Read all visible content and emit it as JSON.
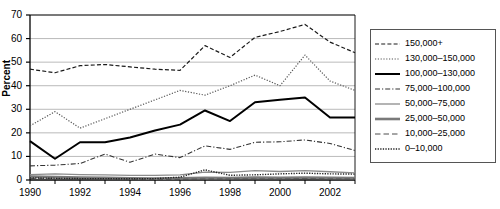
{
  "chart_data": {
    "type": "line",
    "title": "",
    "xlabel": "",
    "ylabel": "Percent",
    "xlim": [
      1990,
      2003
    ],
    "ylim": [
      0,
      70
    ],
    "yticks": [
      0,
      10,
      20,
      30,
      40,
      50,
      60,
      70
    ],
    "xticks": [
      1990,
      1992,
      1994,
      1996,
      1998,
      2000,
      2002
    ],
    "xtick_labels": [
      "1990",
      "1992",
      "1994",
      "1996",
      "1998",
      "2000",
      "2002"
    ],
    "ytick_labels": [
      "0",
      "10",
      "20",
      "30",
      "40",
      "50",
      "60",
      "70"
    ],
    "x": [
      1990,
      1991,
      1992,
      1993,
      1994,
      1995,
      1996,
      1997,
      1998,
      1999,
      2000,
      2001,
      2002,
      2003
    ],
    "grid": "horizontal",
    "legend_position": "right",
    "series": [
      {
        "name": "150,000+",
        "style": "dashed",
        "color": "#1a1a1a",
        "width": 1.2,
        "values": [
          47,
          45.5,
          48.5,
          49,
          48,
          47,
          46.5,
          57,
          52,
          60.5,
          63,
          66,
          58.5,
          54
        ]
      },
      {
        "name": "130,000–150,000",
        "style": "dotted",
        "color": "#555555",
        "width": 1.2,
        "values": [
          23,
          29,
          22,
          26,
          30,
          34,
          38,
          36,
          40,
          44.5,
          40,
          53,
          42,
          38
        ]
      },
      {
        "name": "100,000–130,000",
        "style": "solid",
        "color": "#000000",
        "width": 2.0,
        "values": [
          16.5,
          9,
          16,
          16,
          18,
          21,
          23.5,
          29.5,
          25,
          33,
          34,
          35,
          26.5,
          26.5
        ]
      },
      {
        "name": "75,000–100,000",
        "style": "dashdot",
        "color": "#333333",
        "width": 1.1,
        "values": [
          6,
          6.3,
          7,
          11,
          7.5,
          11,
          9.5,
          14.5,
          13,
          16,
          16.2,
          17,
          15.5,
          12.5
        ]
      },
      {
        "name": "50,000–75,000",
        "style": "solid",
        "color": "#8c8c8c",
        "width": 1.3,
        "values": [
          2.3,
          2.6,
          2.3,
          2.2,
          2.0,
          2.0,
          2.2,
          3.3,
          3.2,
          4.0,
          3.6,
          4.0,
          3.5,
          3.0
        ]
      },
      {
        "name": "25,000–50,000",
        "style": "solid",
        "color": "#7a7a7a",
        "width": 2.6,
        "values": [
          1.5,
          1.2,
          1.0,
          0.9,
          0.7,
          0.6,
          0.7,
          0.9,
          0.8,
          1.0,
          0.9,
          1.0,
          0.9,
          0.8
        ]
      },
      {
        "name": "10,000–25,000",
        "style": "dashed-long",
        "color": "#4d4d4d",
        "width": 1.0,
        "values": [
          0.6,
          0.5,
          0.4,
          0.4,
          0.3,
          0.3,
          0.3,
          0.4,
          0.4,
          0.4,
          0.4,
          0.5,
          0.4,
          0.4
        ]
      },
      {
        "name": "0–10,000",
        "style": "dotted-fine",
        "color": "#222222",
        "width": 1.4,
        "values": [
          0.9,
          0.7,
          0.6,
          0.6,
          0.5,
          0.6,
          1.2,
          4.3,
          2.0,
          2.2,
          2.6,
          2.9,
          2.6,
          2.5
        ]
      }
    ]
  },
  "legend": {
    "items": [
      {
        "label": "150,000+"
      },
      {
        "label": "130,000–150,000"
      },
      {
        "label": "100,000–130,000"
      },
      {
        "label": "75,000–100,000"
      },
      {
        "label": "50,000–75,000"
      },
      {
        "label": "25,000–50,000"
      },
      {
        "label": "10,000–25,000"
      },
      {
        "label": "0–10,000"
      }
    ]
  }
}
